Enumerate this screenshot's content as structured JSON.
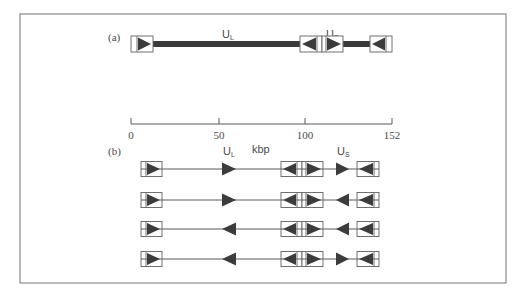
{
  "figure": {
    "frame": {
      "x": 20,
      "y": 14,
      "w": 486,
      "h": 269,
      "stroke": "#8a8a8a"
    },
    "colors": {
      "ink": "#3a3a3a",
      "box_stroke": "#707070",
      "fill_triangle": "#3c3c3c",
      "bar": "#3a3a3a",
      "thin_line": "#5a5a5a",
      "text": "#4a4a4a"
    },
    "panel_a": {
      "label": "(a)",
      "segments": [
        {
          "name": "UL",
          "label_main": "U",
          "label_sub": "L"
        },
        {
          "name": "US",
          "label_main": "U",
          "label_sub": "S"
        }
      ],
      "scale": {
        "ticks": [
          {
            "value": "0",
            "x": 131
          },
          {
            "value": "50",
            "x": 219
          },
          {
            "value": "100",
            "x": 305
          },
          {
            "value": "152",
            "x": 392
          }
        ],
        "unit": "kbp"
      }
    },
    "panel_b": {
      "label": "(b)",
      "segments": [
        {
          "name": "UL",
          "label_main": "U",
          "label_sub": "L"
        },
        {
          "name": "US",
          "label_main": "U",
          "label_sub": "S"
        }
      ],
      "isomers": [
        {
          "ul_direction": "right",
          "us_direction": "right"
        },
        {
          "ul_direction": "right",
          "us_direction": "left"
        },
        {
          "ul_direction": "left",
          "us_direction": "left"
        },
        {
          "ul_direction": "left",
          "us_direction": "right"
        }
      ]
    }
  }
}
